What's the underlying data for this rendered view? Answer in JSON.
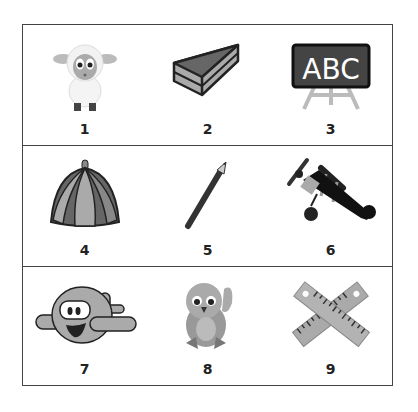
{
  "worksheet": {
    "rows": [
      {
        "items": [
          {
            "number": "1",
            "picture": "sheep"
          },
          {
            "number": "2",
            "picture": "cake-slice"
          },
          {
            "number": "3",
            "picture": "chalkboard-abc"
          }
        ]
      },
      {
        "items": [
          {
            "number": "4",
            "picture": "cap"
          },
          {
            "number": "5",
            "picture": "pencil"
          },
          {
            "number": "6",
            "picture": "biplane"
          }
        ]
      },
      {
        "items": [
          {
            "number": "7",
            "picture": "cartoon-airplane"
          },
          {
            "number": "8",
            "picture": "bird"
          },
          {
            "number": "9",
            "picture": "crossed-rulers"
          }
        ]
      }
    ],
    "chalkboard_text": "ABC"
  }
}
